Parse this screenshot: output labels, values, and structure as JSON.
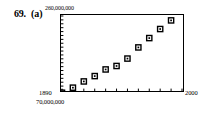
{
  "figure": {
    "problem_number": "69.",
    "part_label": "(a)"
  },
  "chart_data": {
    "type": "scatter",
    "title": "",
    "subtitle": "",
    "xlabel": "",
    "ylabel": "",
    "xlim": [
      1890,
      2000
    ],
    "ylim": [
      70000000,
      260000000
    ],
    "x_tick_labels": [
      "1890",
      "2000"
    ],
    "y_tick_labels": [
      "70,000,000",
      "260,000,000"
    ],
    "axis_corner_label": "70,000,000",
    "y_max_label": "260,000,000",
    "x_min_label": "1890",
    "x_max_label": "2000",
    "grid": false,
    "legend": null,
    "marker": "square-open-with-center-dot",
    "marker_color": "#000000",
    "x": [
      1890,
      1900,
      1910,
      1920,
      1930,
      1940,
      1950,
      1960,
      1970,
      1980,
      1990,
      2000
    ],
    "values": [
      62947714,
      75994575,
      91972266,
      105710620,
      122775046,
      131669275,
      150697361,
      179323175,
      203302031,
      226542199,
      248709873,
      281421906
    ],
    "points": [
      {
        "x": 1890,
        "y": 62947714
      },
      {
        "x": 1900,
        "y": 75994575
      },
      {
        "x": 1910,
        "y": 91972266
      },
      {
        "x": 1920,
        "y": 105710620
      },
      {
        "x": 1930,
        "y": 122775046
      },
      {
        "x": 1940,
        "y": 131669275
      },
      {
        "x": 1950,
        "y": 150697361
      },
      {
        "x": 1960,
        "y": 179323175
      },
      {
        "x": 1970,
        "y": 203302031
      },
      {
        "x": 1980,
        "y": 226542199
      },
      {
        "x": 1990,
        "y": 248709873
      }
    ],
    "x_minor_tick_count": 11,
    "y_minor_tick_count": 19
  }
}
